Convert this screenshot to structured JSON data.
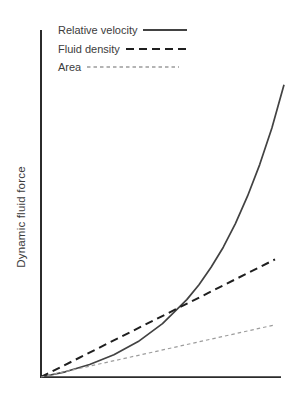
{
  "figure": {
    "background": "#ffffff",
    "axis_color": "#2b2b2b"
  },
  "chart_data": {
    "type": "line",
    "title": "",
    "xlabel": "",
    "ylabel": "Dynamic fluid force",
    "axes": {
      "x_range": [
        0,
        1
      ],
      "y_range": [
        0,
        1
      ],
      "ticks": "none",
      "grid": false
    },
    "legend": {
      "position": "top-left",
      "entries": [
        "Relative velocity",
        "Fluid density",
        "Area"
      ]
    },
    "series": [
      {
        "name": "Relative velocity",
        "line_style": "solid",
        "color": "#424242",
        "x": [
          0,
          0.1,
          0.2,
          0.3,
          0.4,
          0.5,
          0.6,
          0.65,
          0.7,
          0.75,
          0.8,
          0.85,
          0.9,
          0.95,
          1.0
        ],
        "y": [
          0,
          0.015,
          0.036,
          0.064,
          0.102,
          0.154,
          0.223,
          0.266,
          0.316,
          0.374,
          0.442,
          0.521,
          0.612,
          0.718,
          0.842
        ]
      },
      {
        "name": "Fluid density",
        "line_style": "dashed",
        "color": "#1f1f1f",
        "x": [
          0,
          0.963
        ],
        "y": [
          0,
          0.339
        ]
      },
      {
        "name": "Area",
        "line_style": "fine-dashed",
        "color": "#9c9c9c",
        "x": [
          0,
          0.955
        ],
        "y": [
          0,
          0.149
        ]
      }
    ]
  }
}
